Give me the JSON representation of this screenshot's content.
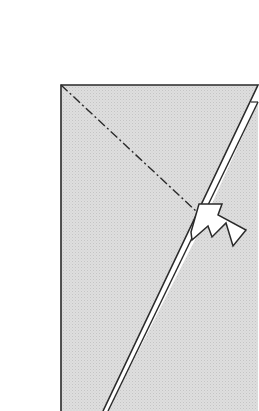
{
  "diagram": {
    "type": "origami-fold-step",
    "background": "#ffffff",
    "paper_fill": "#dcdcdc",
    "paper_pattern_dot": "#c6c6c6",
    "stroke": "#2a2a2a",
    "elements": {
      "front_layer": {
        "description": "front paper layer (kite flap)"
      },
      "back_layer": {
        "description": "back paper layer edge visible on right"
      },
      "fold_line": {
        "style": "dash-dot",
        "description": "mountain/valley fold line from top-left corner"
      },
      "arrow": {
        "description": "push/sink arrow pointing at fold point",
        "fill": "#ffffff"
      }
    }
  }
}
